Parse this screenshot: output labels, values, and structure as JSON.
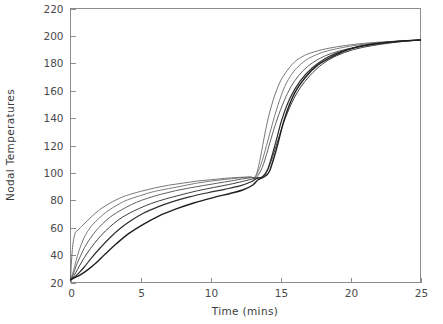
{
  "chart_data": {
    "type": "line",
    "title": "",
    "xlabel": "Time  (mins)",
    "ylabel": "Nodal  Temperatures",
    "xlim": [
      0,
      25
    ],
    "ylim": [
      20,
      220
    ],
    "xticks": [
      0,
      5,
      10,
      15,
      20,
      25
    ],
    "yticks": [
      20,
      40,
      60,
      80,
      100,
      120,
      140,
      160,
      180,
      200,
      220
    ],
    "xtick_labels": [
      "0",
      "5",
      "10",
      "15",
      "20",
      "25"
    ],
    "ytick_labels": [
      "20",
      "40",
      "60",
      "80",
      "100",
      "120",
      "140",
      "160",
      "180",
      "200",
      "220"
    ],
    "grid": false,
    "legend": null,
    "legend_position": "none",
    "frame": "box",
    "line_color": "#3a3a3a",
    "background_color": "#ffffff",
    "annotations": [
      {
        "text": "first plateau",
        "value": 97,
        "x": 12.5
      },
      {
        "text": "step rise onset",
        "value": 97,
        "x": 13.2
      },
      {
        "text": "final convergence",
        "value": 197,
        "x": 25
      }
    ],
    "series": [
      {
        "name": "node-1",
        "color": "#555555",
        "width": 0.8,
        "x": [
          0,
          0.1,
          0.2,
          0.35,
          0.5,
          0.7,
          0.9,
          1.2,
          1.5,
          2,
          2.5,
          3,
          3.5,
          4,
          5,
          6,
          7,
          8,
          9,
          10,
          11,
          12,
          12.8,
          13.2,
          13.5,
          13.8,
          14.1,
          14.5,
          15,
          15.5,
          16,
          16.5,
          17,
          18,
          19,
          20,
          21,
          22,
          23,
          24,
          25
        ],
        "y": [
          22,
          40,
          50,
          56.5,
          58,
          60,
          62,
          65,
          68,
          72.5,
          76,
          79,
          81.5,
          83.5,
          86.5,
          89,
          91,
          92.5,
          94,
          95,
          96,
          96.7,
          97,
          97.2,
          108,
          124,
          139,
          154,
          167,
          175,
          181,
          184.5,
          187,
          190,
          192,
          193.5,
          194.6,
          195.4,
          196,
          196.5,
          197
        ]
      },
      {
        "name": "node-2",
        "color": "#5a5a5a",
        "width": 0.8,
        "x": [
          0,
          0.2,
          0.4,
          0.6,
          0.9,
          1.2,
          1.6,
          2,
          2.5,
          3,
          3.5,
          4,
          5,
          6,
          7,
          8,
          9,
          10,
          11,
          12,
          12.8,
          13.2,
          13.6,
          14,
          14.4,
          14.8,
          15.3,
          15.8,
          16.3,
          17,
          18,
          19,
          20,
          21,
          22,
          23,
          24,
          25
        ],
        "y": [
          22,
          28,
          36,
          43,
          51,
          57,
          62.5,
          66.5,
          71,
          74.5,
          77.5,
          80,
          83.5,
          86.5,
          88.5,
          90.5,
          92.5,
          94,
          95.2,
          96.3,
          97,
          97.2,
          106,
          120,
          135,
          149,
          163,
          172,
          178,
          183.5,
          188,
          190.6,
          192.5,
          194,
          195,
          195.8,
          196.4,
          197
        ]
      },
      {
        "name": "node-3",
        "color": "#4f4f4f",
        "width": 0.9,
        "x": [
          0,
          0.2,
          0.4,
          0.7,
          1,
          1.4,
          1.8,
          2.3,
          2.8,
          3.3,
          4,
          4.7,
          5.5,
          6.5,
          7.5,
          8.5,
          9.5,
          10.5,
          11.5,
          12.4,
          13,
          13.3,
          13.7,
          14.1,
          14.5,
          15,
          15.5,
          16,
          16.6,
          17.3,
          18.2,
          19.2,
          20.3,
          21.5,
          22.7,
          24,
          25
        ],
        "y": [
          22,
          26,
          32,
          39,
          45.5,
          52,
          57.5,
          63,
          67.5,
          71,
          75,
          78.5,
          81.5,
          84.5,
          87,
          89,
          90.8,
          92.5,
          94.2,
          95.8,
          96.6,
          97,
          104,
          117,
          131,
          146,
          158,
          167,
          174.5,
          180.5,
          185.5,
          189,
          191.5,
          193.5,
          195,
          196.2,
          197
        ]
      },
      {
        "name": "node-4",
        "color": "#3f3f3f",
        "width": 1.0,
        "x": [
          0,
          0.25,
          0.5,
          0.8,
          1.2,
          1.7,
          2.2,
          2.8,
          3.4,
          4.1,
          4.9,
          5.8,
          6.8,
          7.9,
          9,
          10.2,
          11.3,
          12.3,
          13,
          13.4,
          13.8,
          14.2,
          14.7,
          15.2,
          15.8,
          16.4,
          17.1,
          18,
          19,
          20.2,
          21.5,
          22.8,
          24,
          25
        ],
        "y": [
          22,
          25,
          29.5,
          35,
          41.5,
          48.5,
          54.5,
          60.5,
          65.5,
          70,
          74,
          77.8,
          81,
          84,
          86.8,
          89.3,
          91.5,
          93.8,
          95.6,
          96.5,
          97.1,
          105,
          120,
          136,
          151,
          162,
          171,
          179.5,
          185.5,
          190,
          192.8,
          194.8,
          196.2,
          197
        ]
      },
      {
        "name": "node-5",
        "color": "#2e2e2e",
        "width": 1.2,
        "x": [
          0,
          0.3,
          0.6,
          1,
          1.5,
          2.1,
          2.8,
          3.5,
          4.3,
          5.2,
          6.2,
          7.3,
          8.5,
          9.8,
          11,
          12.1,
          12.9,
          13.3,
          13.7,
          14.1,
          14.6,
          15.1,
          15.7,
          16.4,
          17.2,
          18.2,
          19.3,
          20.5,
          21.8,
          23.1,
          24.2,
          25
        ],
        "y": [
          22,
          24,
          27,
          31.5,
          38,
          45,
          52.5,
          59,
          65,
          70.5,
          75,
          79,
          82.5,
          85.5,
          88,
          90.5,
          93.5,
          96,
          97.2,
          103,
          120,
          139,
          155,
          167,
          176,
          183.5,
          188.5,
          192,
          194.3,
          195.8,
          196.6,
          197
        ]
      },
      {
        "name": "node-6",
        "color": "#1f1f1f",
        "width": 1.4,
        "x": [
          0,
          0.3,
          0.7,
          1.2,
          1.8,
          2.5,
          3.3,
          4.2,
          5.2,
          6.3,
          7.5,
          8.8,
          10.2,
          11.4,
          12.3,
          13,
          13.4,
          13.8,
          14.2,
          14.7,
          15.3,
          16,
          16.8,
          17.7,
          18.8,
          20,
          21.3,
          22.6,
          23.8,
          25
        ],
        "y": [
          22,
          23.5,
          25.5,
          29,
          34,
          41,
          48.5,
          56,
          62.5,
          68.5,
          73.5,
          78,
          82,
          85,
          87.5,
          91,
          95,
          97,
          101,
          117,
          140,
          158,
          170,
          179,
          185.5,
          190.5,
          193.5,
          195.3,
          196.4,
          197
        ]
      }
    ]
  }
}
